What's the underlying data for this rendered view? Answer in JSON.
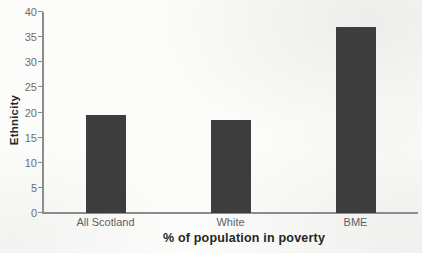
{
  "figure": {
    "background_color": "#fcfcfb",
    "bar_color": "#3d3d3d",
    "axis_color": "#8c8c8c",
    "tick_label_color": "#6e6e6e",
    "category_label_color": "#5f5f5f",
    "axis_title_color": "#262626"
  },
  "chart_data": {
    "type": "bar",
    "categories": [
      "All Scotland",
      "White",
      "BME"
    ],
    "values": [
      19.5,
      18.5,
      37
    ],
    "title": "",
    "xlabel": "% of population in poverty",
    "ylabel": "Ethnicity",
    "ylim": [
      0,
      40
    ],
    "ytick_step": 5,
    "yticks": [
      0,
      5,
      10,
      15,
      20,
      25,
      30,
      35,
      40
    ],
    "grid": false,
    "legend": false,
    "bar_width_px": 40
  }
}
